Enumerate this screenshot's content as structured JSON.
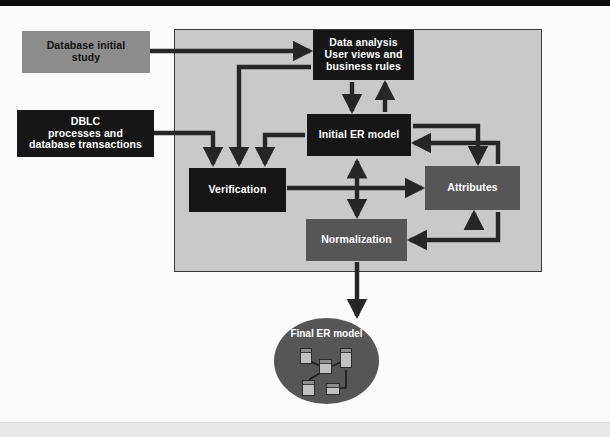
{
  "page": {
    "top_bar_color": "#0d0d0d",
    "panel_background": "#c9c9c9",
    "panel_border_color": "#3a3a3a",
    "canvas_background": "#fbfbfb"
  },
  "palette": {
    "dark_box": "#161616",
    "mid_box": "#565656",
    "light_box": "#8c8c8c",
    "arrow": "#262626",
    "dark_text": "#111111",
    "light_text": "#ffffff"
  },
  "nodes": {
    "database_initial_study": {
      "label": "Database initial\nstudy",
      "line1": "Database initial",
      "line2": "study",
      "style": "light",
      "inside_panel": false
    },
    "dblc": {
      "label": "DBLC processes and database transactions",
      "line1": "DBLC",
      "line2": "processes and",
      "line3": "database transactions",
      "style": "dark",
      "inside_panel": false
    },
    "data_analysis": {
      "label": "Data analysis User views and business rules",
      "line1": "Data analysis",
      "line2": "User views and",
      "line3": "business rules",
      "style": "dark",
      "inside_panel": true
    },
    "initial_er_model": {
      "label": "Initial ER model",
      "style": "dark",
      "inside_panel": true
    },
    "verification": {
      "label": "Verification",
      "style": "dark",
      "inside_panel": true
    },
    "attributes": {
      "label": "Attributes",
      "style": "mid",
      "inside_panel": true
    },
    "normalization": {
      "label": "Normalization",
      "style": "mid",
      "inside_panel": true
    },
    "final_er_model": {
      "label": "Final ER model",
      "style": "mid-ellipse",
      "inside_panel": false,
      "contains_mini_er_diagram": true,
      "mini_entity_count": 5
    }
  },
  "connections": [
    {
      "from": "database_initial_study",
      "to": "data_analysis",
      "arrow": "single"
    },
    {
      "from": "dblc",
      "to": "verification",
      "arrow": "single"
    },
    {
      "from": "data_analysis",
      "to": "initial_er_model",
      "arrow": "single"
    },
    {
      "from": "initial_er_model",
      "to": "data_analysis",
      "arrow": "single"
    },
    {
      "from": "data_analysis",
      "to": "verification",
      "arrow": "single"
    },
    {
      "from": "initial_er_model",
      "to": "verification",
      "arrow": "single"
    },
    {
      "from": "initial_er_model",
      "to": "attributes",
      "arrow": "single"
    },
    {
      "from": "attributes",
      "to": "initial_er_model",
      "arrow": "single"
    },
    {
      "from": "attributes",
      "to": "normalization",
      "arrow": "single"
    },
    {
      "from": "normalization",
      "to": "attributes",
      "arrow": "single"
    },
    {
      "from": "verification",
      "to": "attributes",
      "arrow": "single"
    },
    {
      "from": "initial_er_model",
      "to": "normalization",
      "arrow": "double"
    },
    {
      "from": "normalization",
      "to": "final_er_model",
      "arrow": "single"
    }
  ]
}
